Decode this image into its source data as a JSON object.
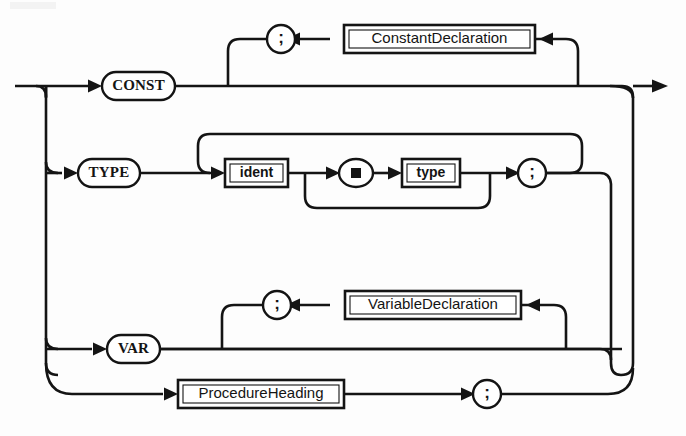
{
  "diagram": {
    "kind": "railroad-syntax-diagram",
    "name": "DeclarationSequence",
    "title": "",
    "colors": {
      "ink": "#141414",
      "paper": "#ffffff"
    },
    "entry_label": "",
    "exit_label": ""
  },
  "rows": {
    "const": {
      "keyword": "CONST",
      "nonterminal": "ConstantDeclaration",
      "separator": ";"
    },
    "type": {
      "keyword": "TYPE",
      "ident": "ident",
      "equals": "=",
      "type": "type",
      "separator": ";"
    },
    "var": {
      "keyword": "VAR",
      "nonterminal": "VariableDeclaration",
      "separator": ";"
    },
    "procedure": {
      "nonterminal": "ProcedureHeading",
      "separator": ";"
    }
  }
}
